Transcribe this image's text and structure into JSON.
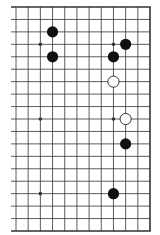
{
  "diagram": {
    "type": "go-board-fragment",
    "board_size": 19,
    "visible_columns": [
      7,
      18
    ],
    "visible_rows": [
      0,
      18
    ],
    "edges": {
      "top": true,
      "right": true,
      "bottom": true,
      "left": false
    },
    "colors": {
      "background": "#ffffff",
      "line": "#333333",
      "black_stone": "#111111",
      "white_stone": "#ffffff",
      "white_outline": "#222222"
    },
    "star_points": [
      {
        "col": 9,
        "row": 3
      },
      {
        "col": 15,
        "row": 3
      },
      {
        "col": 9,
        "row": 9
      },
      {
        "col": 15,
        "row": 9
      },
      {
        "col": 9,
        "row": 15
      },
      {
        "col": 15,
        "row": 15
      }
    ],
    "stones": [
      {
        "color": "black",
        "col": 10,
        "row": 2
      },
      {
        "color": "black",
        "col": 10,
        "row": 4
      },
      {
        "color": "black",
        "col": 16,
        "row": 3
      },
      {
        "color": "black",
        "col": 15,
        "row": 4
      },
      {
        "color": "white",
        "col": 15,
        "row": 6
      },
      {
        "color": "white",
        "col": 16,
        "row": 9
      },
      {
        "color": "black",
        "col": 16,
        "row": 11
      },
      {
        "color": "black",
        "col": 15,
        "row": 15
      }
    ]
  }
}
